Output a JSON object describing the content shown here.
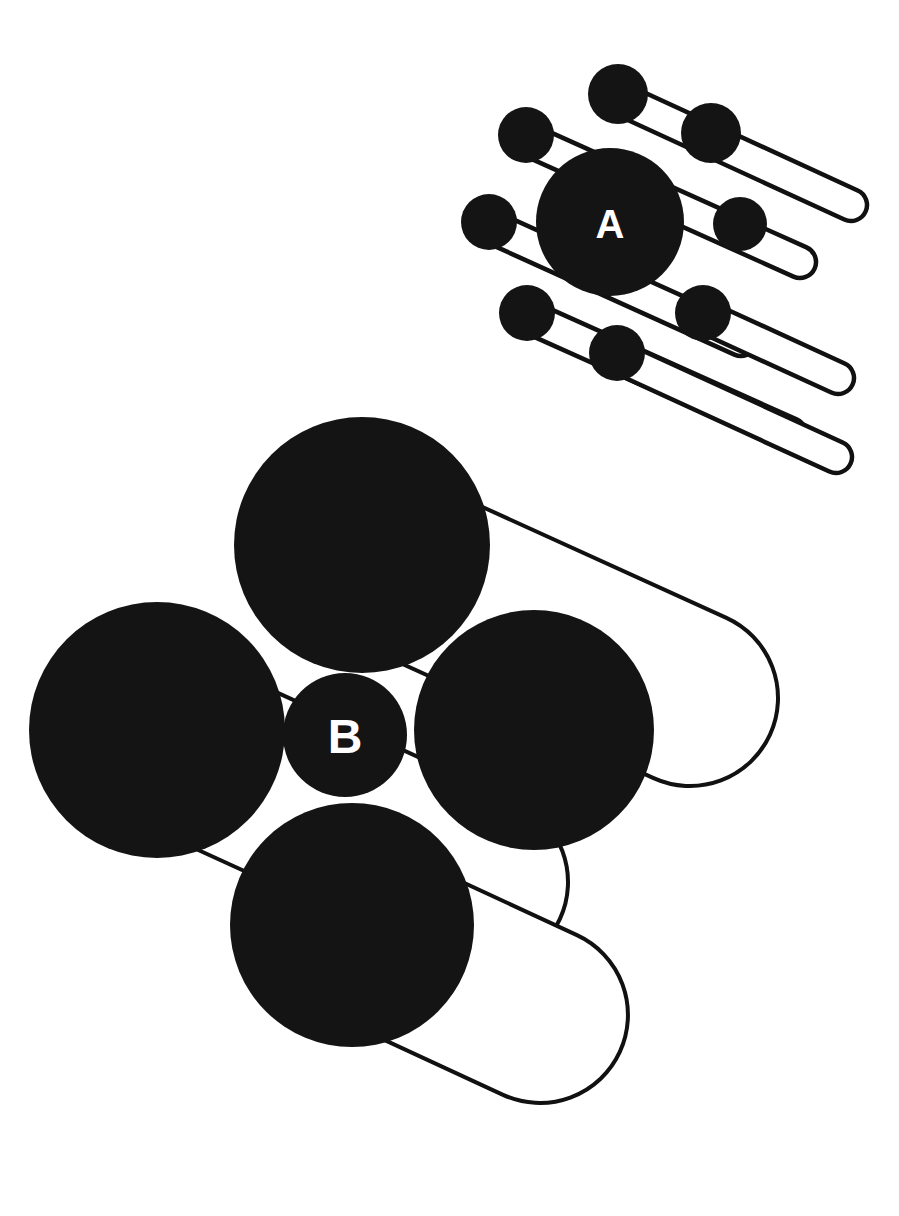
{
  "figure": {
    "background_color": "#ffffff",
    "sphere_color": "#141414",
    "rod_fill_color": "#ffffff",
    "rod_stroke_color": "#111111",
    "label_color": "#ffffff",
    "canvas": {
      "width": 899,
      "height": 1216
    }
  },
  "structures": [
    {
      "id": "structure-a",
      "label": "A",
      "label_position": {
        "x": 610,
        "y": 224
      },
      "label_font_size": 40,
      "description": "Upper small-scale packing unit with one large central sphere, eight small corner spheres and six white capsule rods",
      "rod_stroke_width": 4.5,
      "rod_thickness": 30,
      "spheres": [
        {
          "name": "center-large",
          "cx": 610,
          "cy": 222,
          "r": 74
        },
        {
          "name": "corner-top",
          "cx": 618,
          "cy": 94,
          "r": 30
        },
        {
          "name": "corner-upper-left",
          "cx": 526,
          "cy": 135,
          "r": 28
        },
        {
          "name": "corner-left",
          "cx": 489,
          "cy": 222,
          "r": 28
        },
        {
          "name": "corner-lower-left",
          "cx": 527,
          "cy": 313,
          "r": 28
        },
        {
          "name": "corner-bottom",
          "cx": 617,
          "cy": 353,
          "r": 28
        },
        {
          "name": "corner-lower-right",
          "cx": 703,
          "cy": 313,
          "r": 28
        },
        {
          "name": "corner-upper-right",
          "cx": 711,
          "cy": 133,
          "r": 30
        },
        {
          "name": "corner-right-inner",
          "cx": 740,
          "cy": 224,
          "r": 27
        }
      ],
      "rods": [
        {
          "name": "rod-a-1",
          "x1": 524,
          "y1": 138,
          "x2": 800,
          "y2": 262,
          "width": 32
        },
        {
          "name": "rod-a-2",
          "x1": 616,
          "y1": 97,
          "x2": 851,
          "y2": 205,
          "width": 32
        },
        {
          "name": "rod-a-3",
          "x1": 489,
          "y1": 226,
          "x2": 741,
          "y2": 340,
          "width": 32
        },
        {
          "name": "rod-a-4",
          "x1": 529,
          "y1": 317,
          "x2": 790,
          "y2": 434,
          "width": 32
        },
        {
          "name": "rod-a-5",
          "x1": 618,
          "y1": 357,
          "x2": 836,
          "y2": 457,
          "width": 32
        },
        {
          "name": "rod-a-6",
          "x1": 707,
          "y1": 318,
          "x2": 838,
          "y2": 378,
          "width": 32
        }
      ]
    },
    {
      "id": "structure-b",
      "label": "B",
      "label_position": {
        "x": 345,
        "y": 736
      },
      "label_font_size": 48,
      "description": "Lower large-scale packing unit with four large spheres around a small central sphere labelled B, plus large white capsule rods",
      "rod_stroke_width": 4,
      "rod_thickness": 175,
      "spheres": [
        {
          "name": "large-top",
          "cx": 362,
          "cy": 545,
          "r": 128
        },
        {
          "name": "large-left",
          "cx": 157,
          "cy": 730,
          "r": 128
        },
        {
          "name": "large-right",
          "cx": 534,
          "cy": 730,
          "r": 120
        },
        {
          "name": "large-bottom",
          "cx": 352,
          "cy": 925,
          "r": 122
        },
        {
          "name": "center-small",
          "cx": 345,
          "cy": 735,
          "r": 62
        }
      ],
      "rods": [
        {
          "name": "rod-b-1",
          "x1": 360,
          "y1": 548,
          "x2": 690,
          "y2": 698,
          "width": 176
        },
        {
          "name": "rod-b-2",
          "x1": 156,
          "y1": 734,
          "x2": 480,
          "y2": 882,
          "width": 176
        },
        {
          "name": "rod-b-3",
          "x1": 352,
          "y1": 928,
          "x2": 540,
          "y2": 1015,
          "width": 176
        }
      ]
    }
  ],
  "legend": {
    "labels": [
      "A",
      "B"
    ]
  }
}
